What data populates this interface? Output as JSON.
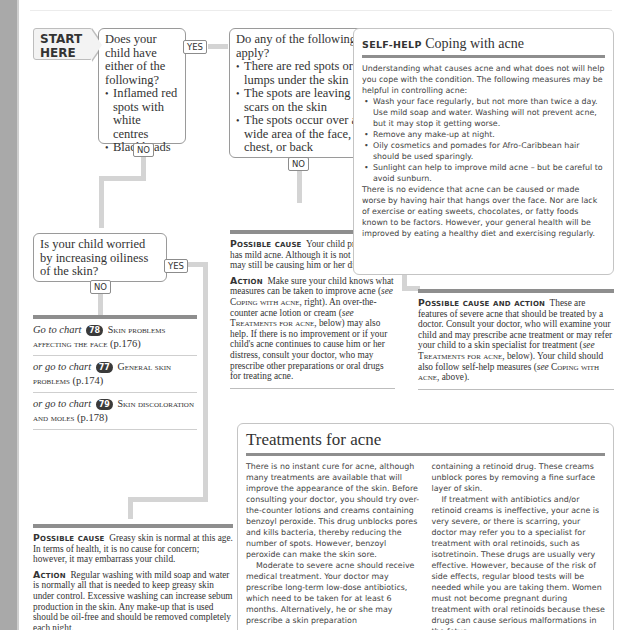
{
  "flowchart": {
    "start_label": [
      "START",
      "HERE"
    ],
    "q1": {
      "text": "Does your child have either of the following?",
      "bullets": [
        "Inflamed red spots with white centres",
        "Blackheads"
      ],
      "yes": "YES",
      "no": "NO"
    },
    "q2": {
      "text": "Do any of the following apply?",
      "bullets": [
        "There are red spots or lumps under the skin",
        "The spots are leaving scars on the skin",
        "The spots occur over a wide area of the face, chest, or back"
      ],
      "yes": "YES",
      "no": "NO"
    },
    "q3": {
      "text": "Is your child worried by increasing oiliness of the skin?",
      "yes": "YES",
      "no": "NO"
    }
  },
  "mild_acne": {
    "cause_head": "Possible cause",
    "cause_text": "Your child probably has mild acne. Although it is not severe, it may still be causing him or her distress.",
    "action_head": "Action",
    "action_text_1": "Make sure your child knows what measures can be taken to improve acne (",
    "see": "see",
    "ref_coping": "Coping with acne",
    "action_text_2": ", right). An over-the-counter acne lotion or cream (",
    "ref_treatments": "Treatments for acne",
    "action_text_3": ", below) may also help. If there is no improvement or if your child's acne continues to cause him or her distress, consult your doctor, who may prescribe other preparations or oral drugs for treating acne."
  },
  "severe_acne": {
    "head": "Possible cause and action",
    "text_1": "These are features of severe acne that should be treated by a doctor. Consult your doctor, who will examine your child and may prescribe acne treatment or may refer your child to a skin specialist for treatment (",
    "see": "see",
    "ref_treatments": "Treatments for acne",
    "text_2": ", below). Your child should also follow self-help measures (",
    "ref_coping": "Coping with acne",
    "text_3": ", above)."
  },
  "chart_links": [
    {
      "prefix": "Go to chart",
      "number": "78",
      "title": "Skin problems affecting the face",
      "page": "(p.176)"
    },
    {
      "prefix": "or go to chart",
      "number": "77",
      "title": "General skin problems",
      "page": "(p.174)"
    },
    {
      "prefix": "or go to chart",
      "number": "79",
      "title": "Skin discoloration and moles",
      "page": "(p.178)"
    }
  ],
  "greasy_skin": {
    "cause_head": "Possible cause",
    "cause_text": "Greasy skin is normal at this age. In terms of health, it is no cause for concern; however, it may embarrass your child.",
    "action_head": "Action",
    "action_text": "Regular washing with mild soap and water is normally all that is needed to keep greasy skin under control. Excessive washing can increase sebum production in the skin. Any make-up that is used should be oil-free and should be removed completely each night."
  },
  "self_help": {
    "kicker": "SELF-HELP",
    "title": "Coping with acne",
    "intro": "Understanding what causes acne and what does not will help you cope with the condition. The following measures may be helpful in controlling acne:",
    "bullets": [
      "Wash your face regularly, but not more than twice a day. Use mild soap and water. Washing will not prevent acne, but it may stop it getting worse.",
      "Remove any make-up at night.",
      "Oily cosmetics and pomades for Afro-Caribbean hair should be used sparingly.",
      "Sunlight can help to improve mild acne – but be careful to avoid sunburn."
    ],
    "outro": "There is no evidence that acne can be caused or made worse by having hair that hangs over the face. Nor are lack of exercise or eating sweets, chocolates, or fatty foods known to be factors. However, your general health will be improved by eating a healthy diet and exercising regularly."
  },
  "treatments": {
    "title": "Treatments for acne",
    "col1_p1": "There is no instant cure for acne, although many treatments are available that will improve the appearance of the skin. Before consulting your doctor, you should try over-the-counter lotions and creams containing benzoyl peroxide. This drug unblocks pores and kills bacteria, thereby reducing the number of spots. However, benzoyl peroxide can make the skin sore.",
    "col1_p2": "Moderate to severe acne should receive medical treatment. Your doctor may prescribe long-term low-dose antibiotics, which need to be taken for at least 6 months. Alternatively, he or she may prescribe a skin preparation",
    "col2_p1": "containing a retinoid drug. These creams unblock pores by removing a fine surface layer of skin.",
    "col2_p2": "If treatment with antibiotics and/or retinoid creams is ineffective, your acne is very severe, or there is scarring, your doctor may refer you to a specialist for treatment with oral retinoids, such as isotretinoin. These drugs are usually very effective. However, because of the risk of side effects, regular blood tests will be needed while you are taking them. Women must not become pregnant during treatment with oral retinoids because these drugs can cause serious malformations in the fetus."
  }
}
